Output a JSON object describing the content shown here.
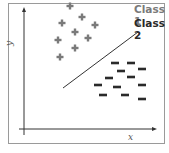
{
  "legend": {
    "class1": "Class 1",
    "class2": "Class 2"
  },
  "axes": {
    "x_label": "x",
    "y_label": "y"
  },
  "colors": {
    "frame": "#9a9a9a",
    "axis": "#333333",
    "plus": "#7a7a7a",
    "minus": "#2a2a2a",
    "boundary": "#333333"
  },
  "chart_data": {
    "type": "scatter",
    "title": "",
    "xlabel": "x",
    "ylabel": "y",
    "series": [
      {
        "name": "Class 1",
        "marker": "plus",
        "points_px": [
          [
            70,
            6
          ],
          [
            62,
            23
          ],
          [
            82,
            17
          ],
          [
            95,
            25
          ],
          [
            75,
            32
          ],
          [
            88,
            38
          ],
          [
            58,
            40
          ],
          [
            75,
            48
          ],
          [
            60,
            57
          ]
        ]
      },
      {
        "name": "Class 2",
        "marker": "minus",
        "points_px": [
          [
            115,
            63
          ],
          [
            131,
            63
          ],
          [
            121,
            71
          ],
          [
            142,
            69
          ],
          [
            109,
            78
          ],
          [
            131,
            77
          ],
          [
            98,
            85
          ],
          [
            117,
            87
          ],
          [
            142,
            85
          ],
          [
            103,
            95
          ],
          [
            125,
            95
          ],
          [
            142,
            99
          ]
        ]
      }
    ],
    "decision_boundary_px": [
      [
        63,
        88
      ],
      [
        138,
        32
      ]
    ]
  }
}
